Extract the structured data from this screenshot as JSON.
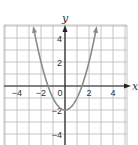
{
  "chart_data": {
    "type": "line",
    "title": "",
    "xlabel": "x",
    "ylabel": "y",
    "xlim": [
      -5,
      5
    ],
    "ylim": [
      -5,
      5
    ],
    "grid": true,
    "grid_step": 1,
    "x_ticks": [
      -4,
      -2,
      0,
      2,
      4
    ],
    "y_ticks": [
      -4,
      -2,
      2,
      4
    ],
    "x_tick_labels": [
      "−4",
      "−2",
      "0",
      "2",
      "4"
    ],
    "y_tick_labels": [
      "−4",
      "−2",
      "2",
      "4"
    ],
    "series": [
      {
        "name": "y = x² − 2",
        "function": "x^2 - 2",
        "domain": [
          -2.6,
          2.6
        ],
        "vertex": [
          0,
          -2
        ],
        "x_intercepts": [
          -1.41,
          1.41
        ],
        "arrows_both_ends": true,
        "color": "#8a8a8a",
        "x": [
          -2.6,
          -2,
          -1.5,
          -1,
          -0.5,
          0,
          0.5,
          1,
          1.5,
          2,
          2.6
        ],
        "y": [
          4.76,
          2,
          0.25,
          -1,
          -1.75,
          -2,
          -1.75,
          -1,
          0.25,
          2,
          4.76
        ]
      }
    ],
    "colors": {
      "grid": "#b8b8b8",
      "axis": "#222222",
      "curve": "#8a8a8a"
    }
  },
  "labels": {
    "x_axis": "x",
    "y_axis": "y",
    "origin": "0"
  }
}
